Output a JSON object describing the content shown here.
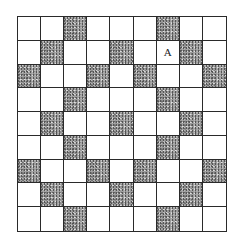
{
  "grid": {
    "rows": 9,
    "cols": 9,
    "shaded_cells": [
      [
        0,
        2
      ],
      [
        0,
        6
      ],
      [
        1,
        1
      ],
      [
        1,
        4
      ],
      [
        1,
        7
      ],
      [
        2,
        0
      ],
      [
        2,
        3
      ],
      [
        2,
        5
      ],
      [
        2,
        8
      ],
      [
        3,
        2
      ],
      [
        3,
        6
      ],
      [
        4,
        1
      ],
      [
        4,
        4
      ],
      [
        4,
        7
      ],
      [
        5,
        2
      ],
      [
        5,
        6
      ],
      [
        6,
        0
      ],
      [
        6,
        3
      ],
      [
        6,
        5
      ],
      [
        6,
        8
      ],
      [
        7,
        1
      ],
      [
        7,
        4
      ],
      [
        7,
        7
      ],
      [
        8,
        2
      ],
      [
        8,
        6
      ]
    ],
    "labels": [
      {
        "row": 1,
        "col": 6,
        "text": "A"
      }
    ],
    "colors": {
      "line": "#2a2a2a",
      "shaded": "#9a9a9a",
      "empty": "#ffffff"
    }
  }
}
